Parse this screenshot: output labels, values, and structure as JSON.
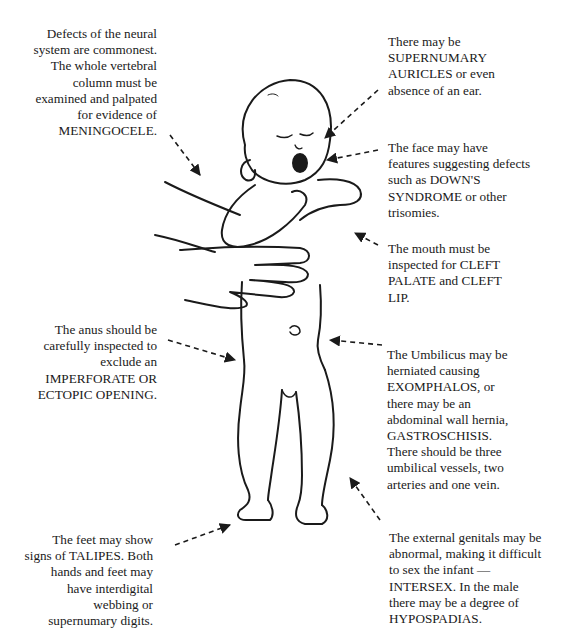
{
  "diagram": {
    "labels": {
      "neural": {
        "text": "Defects of the neural\nsystem are commonest.\nThe whole vertebral\ncolumn must be\nexamined and palpated\nfor evidence of\nMENINGOCELE.",
        "target": "back / vertebral column"
      },
      "anus": {
        "text": "The anus should be\ncarefully inspected to\nexclude an\nIMPERFORATE OR\nECTOPIC OPENING.",
        "target": "anus"
      },
      "feet": {
        "text": "The feet may show\nsigns of TALIPES. Both\nhands and feet may\nhave interdigital\nwebbing or\nsupernumary digits.",
        "target": "feet"
      },
      "ears": {
        "text": "There may be\nSUPERNUMARY\nAURICLES or even\nabsence of an ear.",
        "target": "ear"
      },
      "face": {
        "text": "The face may have\nfeatures suggesting defects\nsuch as DOWN'S\nSYNDROME or other\ntrisomies.",
        "target": "face"
      },
      "mouth": {
        "text": "The mouth must be\ninspected for CLEFT\nPALATE and CLEFT\nLIP.",
        "target": "mouth"
      },
      "umbilicus": {
        "text": "The Umbilicus may be\nherniated causing\nEXOMPHALOS, or\nthere may be an\nabdominal wall hernia,\nGASTROSCHISIS.\nThere should be three\numbilical vessels, two\narteries and one vein.",
        "target": "umbilicus"
      },
      "genitals": {
        "text": "The external genitals may be\nabnormal, making it difficult\nto sex the infant —\nINTERSEX. In the male\nthere may be a degree of\nHYPOSPADIAS.",
        "target": "genitals"
      }
    },
    "colors": {
      "background": "#ffffff",
      "ink": "#1a1a1a"
    }
  }
}
